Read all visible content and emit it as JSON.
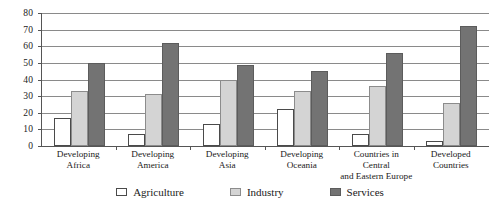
{
  "chart_data": {
    "type": "bar",
    "title": "",
    "subtitle": "",
    "xlabel": "",
    "ylabel": "",
    "ylim": [
      0,
      80
    ],
    "yticks": [
      0,
      10,
      20,
      30,
      40,
      50,
      60,
      70,
      80
    ],
    "grid": true,
    "legend_position": "bottom",
    "categories": [
      "Developing\nAfrica",
      "Developing\nAmerica",
      "Developing\nAsia",
      "Developing\nOceania",
      "Countries in Central\nand Eastern Europe",
      "Developed\nCountries"
    ],
    "category_labels": [
      "Developing Africa",
      "Developing America",
      "Developing Asia",
      "Developing Oceania",
      "Countries in Central and Eastern Europe",
      "Developed Countries"
    ],
    "series": [
      {
        "name": "Agriculture",
        "color": "#ffffff",
        "values": [
          17,
          7,
          13,
          22,
          7,
          3
        ]
      },
      {
        "name": "Industry",
        "color": "#d4d4d4",
        "values": [
          33,
          31,
          40,
          33,
          36,
          26
        ]
      },
      {
        "name": "Services",
        "color": "#737373",
        "values": [
          50,
          62,
          49,
          45,
          56,
          72
        ]
      }
    ]
  },
  "legend": {
    "items": [
      {
        "label": "Agriculture",
        "key": "agriculture"
      },
      {
        "label": "Industry",
        "key": "industry"
      },
      {
        "label": "Services",
        "key": "services"
      }
    ]
  },
  "colors": {
    "agriculture": "#ffffff",
    "industry": "#d4d4d4",
    "services": "#737373",
    "axis": "#555555",
    "gridline": "#8a8a8a",
    "text": "#1a1a1a",
    "background": "#ffffff"
  }
}
